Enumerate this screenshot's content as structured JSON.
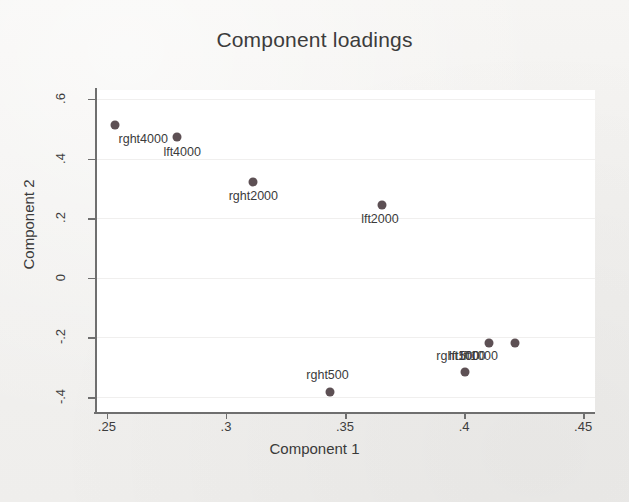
{
  "chart_data": {
    "type": "scatter",
    "title": "Component loadings",
    "xlabel": "Component 1",
    "ylabel": "Component 2",
    "xlim": [
      0.245,
      0.455
    ],
    "ylim": [
      -0.45,
      0.63
    ],
    "xticks": [
      ".25",
      ".3",
      ".35",
      ".4",
      ".45"
    ],
    "xtick_values": [
      0.25,
      0.3,
      0.35,
      0.4,
      0.45
    ],
    "yticks": [
      ".6",
      ".4",
      ".2",
      "0",
      "-.2",
      "-.4"
    ],
    "ytick_values": [
      0.6,
      0.4,
      0.2,
      0,
      -0.2,
      -0.4
    ],
    "grid": true,
    "legend": "none",
    "marker_color": "#5d5054",
    "points": [
      {
        "label": "rght4000",
        "x": 0.2535,
        "y": 0.512,
        "label_dx": 28,
        "label_dy": 7
      },
      {
        "label": "lft4000",
        "x": 0.2795,
        "y": 0.472,
        "label_dx": 5,
        "label_dy": 8
      },
      {
        "label": "rght2000",
        "x": 0.3115,
        "y": 0.322,
        "label_dx": 0,
        "label_dy": 7
      },
      {
        "label": "lft2000",
        "x": 0.3655,
        "y": 0.245,
        "label_dx": -2,
        "label_dy": 7
      },
      {
        "label": "rght500",
        "x": 0.3435,
        "y": -0.382,
        "label_dx": -2,
        "label_dy": -24
      },
      {
        "label": "lft500",
        "x": 0.4005,
        "y": -0.315,
        "label_dx": -1,
        "label_dy": -23
      },
      {
        "label": "rght1000",
        "x": 0.4105,
        "y": -0.218,
        "label_dx": -28,
        "label_dy": 6
      },
      {
        "label": "lft1000",
        "x": 0.4215,
        "y": -0.219,
        "label_dx": -36,
        "label_dy": 6
      }
    ]
  }
}
